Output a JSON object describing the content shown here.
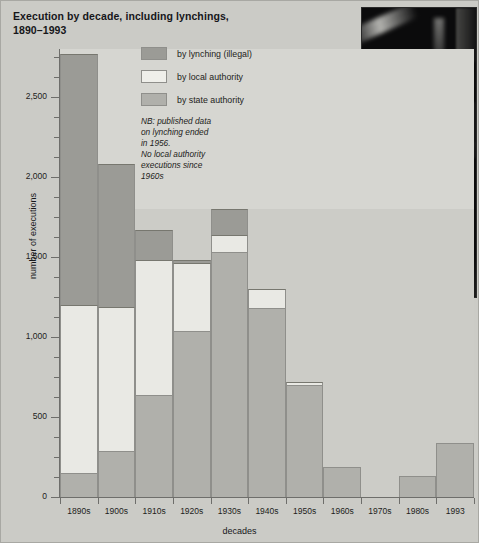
{
  "chart_data": {
    "type": "bar",
    "title": "Execution by decade, including lynchings, 1890–1993",
    "title_line1": "Execution by decade, including lynchings,",
    "title_line2": "1890–1993",
    "xlabel": "decades",
    "ylabel": "number of executions",
    "ylim": [
      0,
      2800
    ],
    "ytick_values": [
      0,
      500,
      1000,
      1500,
      2000,
      2500
    ],
    "ytick_labels": [
      "0",
      "500",
      "1,000",
      "1,500",
      "2,000",
      "2,500"
    ],
    "minor_tick_step": 125,
    "grid": false,
    "stacked": true,
    "legend_position": "inside-top-left",
    "categories": [
      "1890s",
      "1900s",
      "1910s",
      "1920s",
      "1930s",
      "1940s",
      "1950s",
      "1960s",
      "1970s",
      "1980s",
      "1993"
    ],
    "series": [
      {
        "name": "by state authority",
        "color": "#b0b0ab",
        "values": [
          150,
          290,
          640,
          1040,
          1530,
          1180,
          700,
          190,
          0,
          130,
          340
        ]
      },
      {
        "name": "by local authority",
        "color": "#efefea",
        "values": [
          1050,
          900,
          840,
          420,
          110,
          120,
          20,
          0,
          0,
          0,
          0
        ]
      },
      {
        "name": "by lynching (illegal)",
        "color": "#9b9b96",
        "values": [
          1570,
          890,
          190,
          20,
          160,
          0,
          0,
          0,
          0,
          0,
          0
        ]
      }
    ],
    "totals": [
      2770,
      2080,
      1670,
      1480,
      1800,
      1300,
      720,
      190,
      0,
      130,
      340
    ],
    "annotations": [
      "NB: published data on lynching ended in 1956.",
      "No local authority executions since 1960s"
    ]
  },
  "legend": {
    "items": [
      {
        "label": "by lynching (illegal)",
        "swatch": "sw-lynch"
      },
      {
        "label": "by local authority",
        "swatch": "sw-local"
      },
      {
        "label": "by state authority",
        "swatch": "sw-state"
      }
    ],
    "note_lines": [
      "NB: published data",
      "on lynching ended",
      "in 1956.",
      "No local authority",
      "executions since",
      "1960s"
    ]
  },
  "photo": {
    "caption": "",
    "description": "black-and-white photograph inset"
  },
  "colors": {
    "background": "#cbcbc6",
    "plot_background": "#cccac7",
    "plot_band": "#d6d6d1",
    "lynching": "#9b9b96",
    "local_authority": "#efefea",
    "state_authority": "#b0b0ab",
    "axis": "#6e6e6b",
    "text": "#1d1d20"
  }
}
